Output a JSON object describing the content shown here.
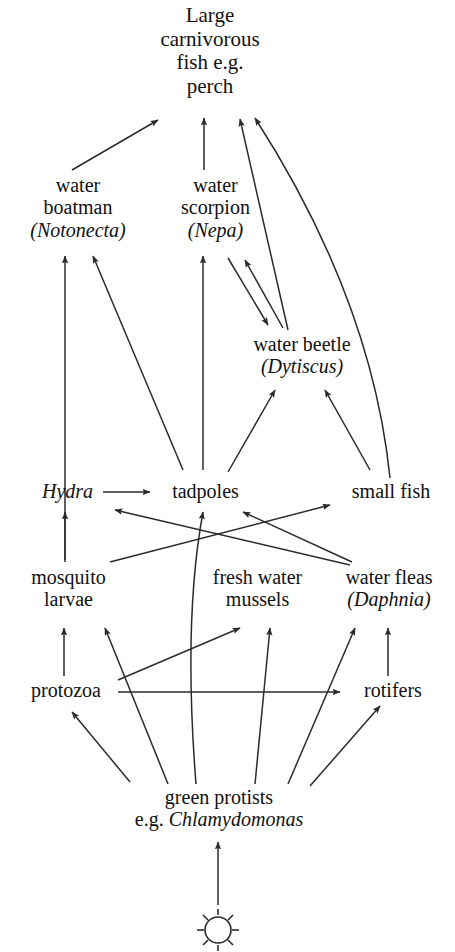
{
  "diagram": {
    "type": "food-web",
    "background_color": "#ffffff",
    "line_color": "#2b2b2b",
    "text_color": "#111111"
  },
  "nodes": {
    "top_predator": {
      "id": "large-carnivorous-fish",
      "lines": [
        "Large",
        "carnivorous",
        "fish e.g.",
        "perch"
      ],
      "line1": "Large",
      "line2": "carnivorous",
      "line3": "fish e.g.",
      "line4": "perch"
    },
    "water_boatman": {
      "id": "water-boatman",
      "line1": "water",
      "line2": "boatman",
      "line3": "(Notonecta)",
      "genus": "Notonecta"
    },
    "water_scorpion": {
      "id": "water-scorpion",
      "line1": "water",
      "line2": "scorpion",
      "line3": "(Nepa)",
      "genus": "Nepa"
    },
    "water_beetle": {
      "id": "water-beetle",
      "line1": "water beetle",
      "line2": "(Dytiscus)",
      "genus": "Dytiscus"
    },
    "hydra": {
      "id": "hydra",
      "line1": "Hydra"
    },
    "tadpoles": {
      "id": "tadpoles",
      "line1": "tadpoles"
    },
    "small_fish": {
      "id": "small-fish",
      "line1": "small fish"
    },
    "mosquito_larvae": {
      "id": "mosquito-larvae",
      "line1": "mosquito",
      "line2": "larvae"
    },
    "fresh_water_mussels": {
      "id": "fresh-water-mussels",
      "line1": "fresh water",
      "line2": "mussels"
    },
    "water_fleas": {
      "id": "water-fleas",
      "line1": "water fleas",
      "line2": "(Daphnia)",
      "genus": "Daphnia"
    },
    "protozoa": {
      "id": "protozoa",
      "line1": "protozoa"
    },
    "rotifers": {
      "id": "rotifers",
      "line1": "rotifers"
    },
    "green_protists": {
      "id": "green-protists",
      "line1": "green  protists",
      "line2_prefix": "e.g. ",
      "line2_genus": "Chlamydomonas"
    },
    "sun": {
      "id": "sun",
      "icon": "sun-icon"
    }
  },
  "edges": [
    {
      "from": "water boatman",
      "to": "Large carnivorous fish e.g. perch"
    },
    {
      "from": "water scorpion",
      "to": "Large carnivorous fish e.g. perch"
    },
    {
      "from": "water beetle",
      "to": "Large carnivorous fish e.g. perch"
    },
    {
      "from": "small fish",
      "to": "Large carnivorous fish e.g. perch"
    },
    {
      "from": "tadpoles",
      "to": "water boatman"
    },
    {
      "from": "mosquito larvae",
      "to": "water boatman"
    },
    {
      "from": "tadpoles",
      "to": "water scorpion"
    },
    {
      "from": "water scorpion",
      "to": "water beetle"
    },
    {
      "from": "water beetle",
      "to": "water scorpion"
    },
    {
      "from": "tadpoles",
      "to": "water beetle"
    },
    {
      "from": "small fish",
      "to": "water beetle"
    },
    {
      "from": "Hydra",
      "to": "tadpoles"
    },
    {
      "from": "water fleas (Daphnia)",
      "to": "Hydra"
    },
    {
      "from": "mosquito larvae",
      "to": "Hydra"
    },
    {
      "from": "green protists",
      "to": "tadpoles"
    },
    {
      "from": "fresh water mussels",
      "to": "small fish"
    },
    {
      "from": "water fleas (Daphnia)",
      "to": "small fish"
    },
    {
      "from": "protozoa",
      "to": "mosquito larvae"
    },
    {
      "from": "green protists",
      "to": "mosquito larvae"
    },
    {
      "from": "protozoa",
      "to": "fresh water mussels"
    },
    {
      "from": "green protists",
      "to": "fresh water mussels"
    },
    {
      "from": "rotifers",
      "to": "water fleas (Daphnia)"
    },
    {
      "from": "green protists",
      "to": "water fleas (Daphnia)"
    },
    {
      "from": "protozoa",
      "to": "rotifers"
    },
    {
      "from": "green protists",
      "to": "rotifers"
    },
    {
      "from": "green protists",
      "to": "protozoa"
    },
    {
      "from": "sun",
      "to": "green protists"
    }
  ]
}
